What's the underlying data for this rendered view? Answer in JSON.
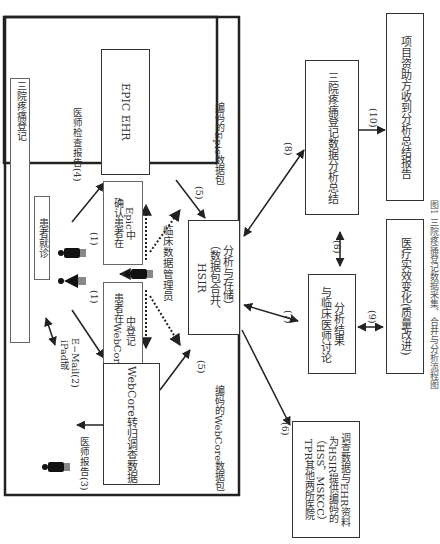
{
  "diagram": {
    "outer_box_label": "三院疼痛登记",
    "nodes": {
      "pain_registry": "三院疼痛登记",
      "patient_visit": "患者就诊",
      "epic_ehr": "EPIC EHR",
      "confirm_epic": [
        "确认患者在",
        "Epic中"
      ],
      "register_webcore": [
        "患者在WebCore",
        "中登记"
      ],
      "webcore_survey": "WebCore转归调查数据",
      "hsir": [
        "HSIR",
        "（数据包合并、",
        "分析与存储）"
      ],
      "other_hospitals": [
        "TPR其他两所医院",
        "（HSS，MSKCC）",
        "为HSIR提供编码的",
        "调查数据与EHR资料"
      ],
      "registry_summary": "三院疼痛登记数据分析总结",
      "clinical_discussion": [
        "与临床医师讨论",
        "分析结果"
      ],
      "funder_report": "项目资助方收到分析总结报告",
      "quality_improvement": "医疗实效变化(质量改进)"
    },
    "labels": {
      "doctor_exam_report": "医师检查报告(4)",
      "ipad_email": [
        "iPad或",
        "E−Mail(2)"
      ],
      "doctor_report": "医师报告(3)",
      "clinical_data_manager": "临床数据管理员",
      "encoded_epic": "编码的Epic数据包",
      "encoded_webcore": "编码的WebCore数据包",
      "step1a": "(1)",
      "step1b": "(1)",
      "step5a": "(5)",
      "step5b": "(5)",
      "step5c": "(5)",
      "step6": "(6)",
      "step7": "(7)",
      "step8a": "(8)",
      "step8b": "(8)",
      "step9": "(9)",
      "step10": "(10)"
    },
    "caption": "图1  三院疼痛登记数据采集、合并与分析流程图"
  },
  "colors": {
    "line": "#222222",
    "box_border": "#333333",
    "background": "#ffffff"
  }
}
